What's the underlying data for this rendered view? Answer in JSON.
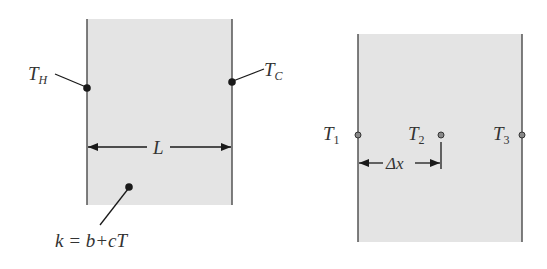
{
  "figure": {
    "colors": {
      "slab_fill": "#e4e4e4",
      "wall_line": "#555555",
      "marker": "#1a1a1a",
      "node_fill": "#888888",
      "text": "#333333"
    },
    "left_panel": {
      "description": "Plane wall with temperature-dependent conductivity",
      "hot_label": {
        "main": "T",
        "sub": "H"
      },
      "cold_label": {
        "main": "T",
        "sub": "C"
      },
      "length_label": "L",
      "conductivity_label": "k = b+cT"
    },
    "right_panel": {
      "description": "Finite-difference nodes across the wall",
      "nodes": [
        {
          "main": "T",
          "sub": "1"
        },
        {
          "main": "T",
          "sub": "2"
        },
        {
          "main": "T",
          "sub": "3"
        }
      ],
      "spacing_label": "Δx"
    }
  }
}
